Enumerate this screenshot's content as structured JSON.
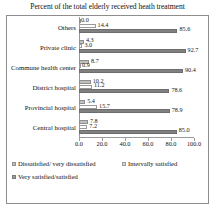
{
  "chart_data": {
    "type": "bar",
    "orientation": "horizontal",
    "title": "Percent of the total elderly received heath treatment",
    "xlabel": "",
    "ylabel": "",
    "xlim": [
      0.0,
      100.0
    ],
    "xticks": [
      "0.0",
      "20.0",
      "40.0",
      "60.0",
      "80.0",
      "100.0"
    ],
    "grid": false,
    "legend_position": "bottom-left",
    "categories": [
      "Others",
      "Private clinic",
      "Commune health center",
      "District hospital",
      "Provincial hospital",
      "Central hospital"
    ],
    "series": [
      {
        "name": "Dissatisfied/ very dissatisfied",
        "color": "#bfbfbf",
        "values": [
          0.0,
          4.3,
          8.7,
          10.2,
          5.4,
          7.8
        ],
        "labels": [
          "0.0",
          "4.3",
          "8.7",
          "10.2",
          "5.4",
          "7.8"
        ]
      },
      {
        "name": "Intervally satisfied",
        "color": "#d9d9d9",
        "values": [
          14.4,
          3.0,
          0.9,
          11.2,
          15.7,
          7.2
        ],
        "labels": [
          "14.4",
          "3.0",
          "0.9",
          "11.2",
          "15.7",
          "7.2"
        ]
      },
      {
        "name": "Very satisfied/satisfied",
        "color": "#9e9e9e",
        "values": [
          85.6,
          92.7,
          90.4,
          78.6,
          78.9,
          85.0
        ],
        "labels": [
          "85.6",
          "92.7",
          "90.4",
          "78.6",
          "78.9",
          "85.0"
        ]
      }
    ]
  }
}
